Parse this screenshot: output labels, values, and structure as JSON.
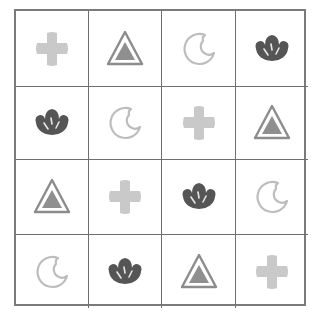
{
  "puzzle": {
    "rows": 4,
    "cols": 4,
    "colors": {
      "grid_line": "#6e6e6e",
      "cross": "#c9c9c9",
      "triangle_outline": "#8c8c8c",
      "triangle_fill": "#8f8f8f",
      "crescent": "#bdbdbd",
      "flower": "#555555",
      "flower_stripe": "#e6e6e6"
    },
    "grid": [
      [
        "cross",
        "triangle",
        "crescent",
        "flower"
      ],
      [
        "flower",
        "crescent",
        "cross",
        "triangle"
      ],
      [
        "triangle",
        "cross",
        "flower",
        "crescent"
      ],
      [
        "crescent",
        "flower",
        "triangle",
        "cross"
      ]
    ]
  }
}
